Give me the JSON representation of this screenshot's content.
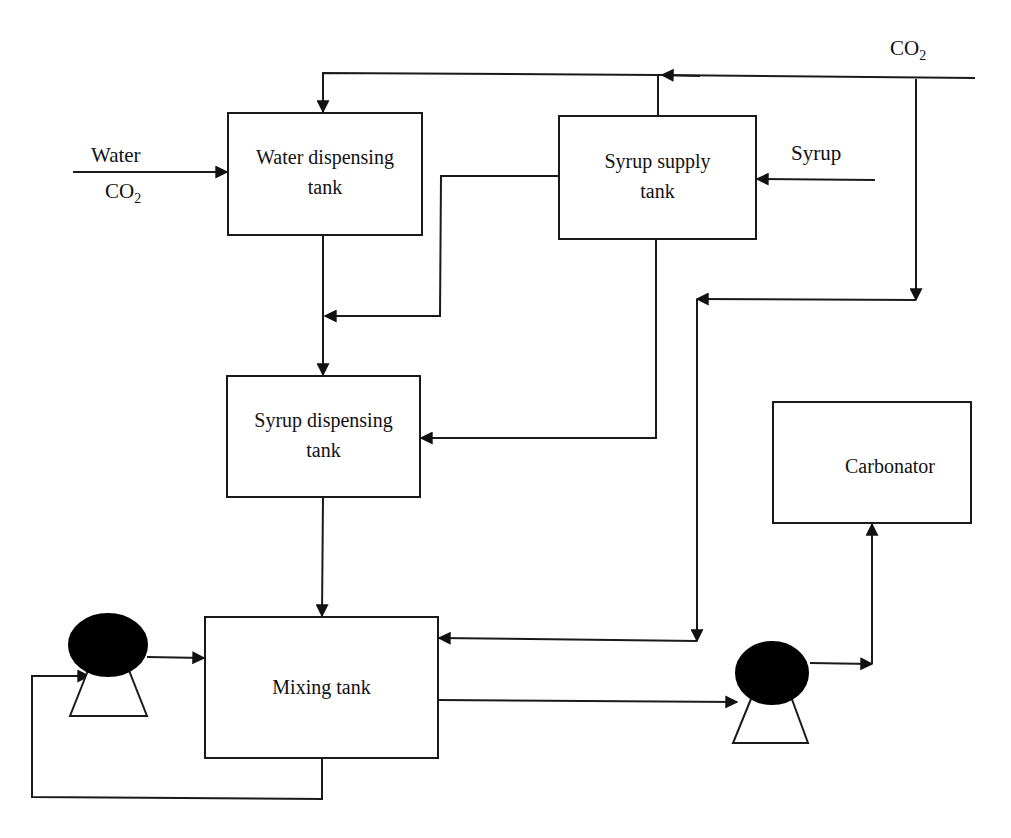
{
  "diagram": {
    "nodes": {
      "water_tank": {
        "line1": "Water dispensing",
        "line2": "tank"
      },
      "syrup_supply": {
        "line1": "Syrup supply",
        "line2": "tank"
      },
      "syrup_dispensing": {
        "line1": "Syrup dispensing",
        "line2": "tank"
      },
      "mixing_tank": {
        "label": "Mixing tank"
      },
      "carbonator": {
        "label": "Carbonator"
      },
      "pump_1": {
        "label": "pump"
      },
      "pump_2": {
        "label": "pump"
      }
    },
    "inputs": {
      "water": "Water",
      "co2_left": {
        "base": "CO",
        "sub": "2"
      },
      "co2_top": {
        "base": "CO",
        "sub": "2"
      },
      "syrup": "Syrup"
    },
    "edges": [
      {
        "from": "CO2 supply",
        "to": "Water dispensing tank"
      },
      {
        "from": "CO2 supply",
        "to": "Syrup supply tank"
      },
      {
        "from": "CO2 supply",
        "to": "Mixing tank"
      },
      {
        "from": "Water + CO2",
        "to": "Water dispensing tank"
      },
      {
        "from": "Syrup",
        "to": "Syrup supply tank"
      },
      {
        "from": "Syrup supply tank",
        "to": "Syrup dispensing tank"
      },
      {
        "from": "Water dispensing tank",
        "to": "Syrup dispensing tank"
      },
      {
        "from": "Syrup dispensing tank",
        "to": "Mixing tank"
      },
      {
        "from": "Pump 1",
        "to": "Mixing tank"
      },
      {
        "from": "Mixing tank",
        "to": "Pump 1 (recycle)"
      },
      {
        "from": "Mixing tank",
        "to": "Pump 2"
      },
      {
        "from": "Pump 2",
        "to": "Carbonator"
      }
    ],
    "colors": {
      "line": "#1a1a1a",
      "fill": "#000000",
      "background": "#ffffff"
    }
  }
}
